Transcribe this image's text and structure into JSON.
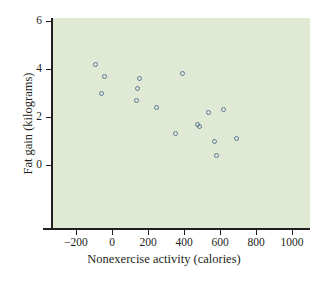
{
  "chart_data": {
    "type": "scatter",
    "title": "",
    "xlabel": "Nonexercise activity (calories)",
    "ylabel": "Fat gain (kilograms)",
    "xlim": [
      -340,
      1060
    ],
    "ylim": [
      -1.4,
      6.4
    ],
    "xticks": [
      -200,
      0,
      200,
      400,
      600,
      800,
      1000
    ],
    "xticklabels": [
      "−200",
      "0",
      "200",
      "400",
      "600",
      "800",
      "1000"
    ],
    "yticks": [
      0,
      2,
      4,
      6
    ],
    "yticklabels": [
      "0",
      "2",
      "4",
      "6"
    ],
    "grid": false,
    "legend": null,
    "marker": "open-circle",
    "marker_color": "#5b7a96",
    "panel_color": "#dfe9d4",
    "axis_color": "#231f20",
    "points": [
      {
        "x": -94,
        "y": 4.2
      },
      {
        "x": -57,
        "y": 3.0
      },
      {
        "x": -43,
        "y": 3.7
      },
      {
        "x": 135,
        "y": 2.7
      },
      {
        "x": 143,
        "y": 3.2
      },
      {
        "x": 151,
        "y": 3.6
      },
      {
        "x": 245,
        "y": 2.4
      },
      {
        "x": 355,
        "y": 1.3
      },
      {
        "x": 392,
        "y": 3.8
      },
      {
        "x": 473,
        "y": 1.7
      },
      {
        "x": 486,
        "y": 1.6
      },
      {
        "x": 535,
        "y": 2.2
      },
      {
        "x": 571,
        "y": 1.0
      },
      {
        "x": 580,
        "y": 0.4
      },
      {
        "x": 620,
        "y": 2.3
      },
      {
        "x": 690,
        "y": 1.1
      }
    ]
  }
}
